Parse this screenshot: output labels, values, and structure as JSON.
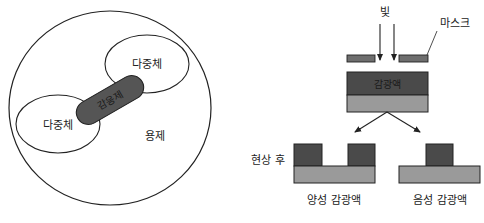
{
  "left_diagram": {
    "title": "micelle structure",
    "labels": {
      "polymer_top": "다중체",
      "polymer_left": "다중체",
      "sensitizer": "감응제",
      "solvent": "용제"
    }
  },
  "right_diagram": {
    "labels": {
      "light": "빛",
      "mask": "마스크",
      "photoresist": "감광액",
      "after_development": "현상 후",
      "positive_resist": "양성 감광액",
      "negative_resist": "음성 감광액"
    }
  },
  "colors": {
    "outline": "#222222",
    "resist_dark": "#4a4a4a",
    "substrate_gray": "#9a9a9a",
    "mask_gray": "#6e6e6e",
    "capsule": "#555555",
    "background": "#ffffff"
  }
}
